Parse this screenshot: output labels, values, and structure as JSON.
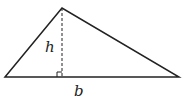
{
  "diagram": {
    "type": "triangle-area",
    "labels": {
      "height": "h",
      "base": "b"
    },
    "colors": {
      "stroke": "#222222",
      "background": "#ffffff"
    }
  }
}
